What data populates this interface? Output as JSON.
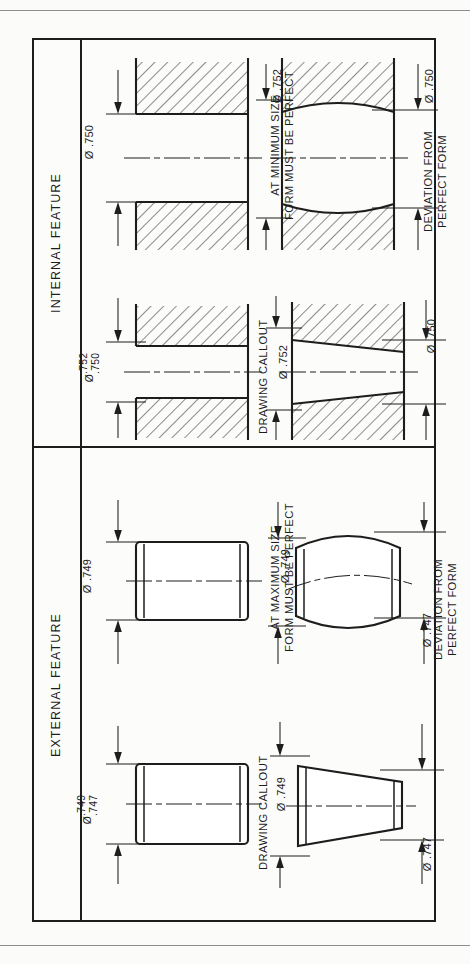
{
  "sheet": {
    "background": "#fbfbfa",
    "line_color": "#1d1d1d"
  },
  "sections": [
    {
      "id": "internal",
      "label": "INTERNAL FEATURE",
      "figures": [
        {
          "id": "internal-callout",
          "caption": "DRAWING CALLOUT",
          "dimensions": [
            {
              "id": "int-callout-dim",
              "symbol": "Ø",
              "values": [
                "  .752",
                "  .750"
              ],
              "position": "left"
            }
          ],
          "shape": "straight-bore-section"
        },
        {
          "id": "internal-taper",
          "caption": "",
          "dimensions": [
            {
              "id": "int-taper-left",
              "text": "Ø .752",
              "position": "left"
            },
            {
              "id": "int-taper-right",
              "text": "Ø .750",
              "position": "right"
            }
          ],
          "shape": "tapered-bore-section"
        },
        {
          "id": "internal-min-size",
          "caption": "AT MINIMUM SIZE\nFORM MUST BE PERFECT",
          "caption_line1": "AT MINIMUM SIZE",
          "caption_line2": "FORM MUST BE PERFECT",
          "dimensions": [
            {
              "id": "int-min-dim",
              "text": "Ø .750",
              "position": "left"
            }
          ],
          "shape": "straight-bore-section"
        },
        {
          "id": "internal-deviation",
          "caption_line1": "DEVIATION FROM",
          "caption_line2": "PERFECT FORM",
          "dimensions": [
            {
              "id": "int-dev-left",
              "text": "Ø .752",
              "position": "left"
            },
            {
              "id": "int-dev-right",
              "text": "Ø .750",
              "position": "right"
            }
          ],
          "shape": "barrel-bore-section"
        }
      ]
    },
    {
      "id": "external",
      "label": "EXTERNAL FEATURE",
      "figures": [
        {
          "id": "external-callout",
          "caption": "DRAWING CALLOUT",
          "dimensions": [
            {
              "id": "ext-callout-dim",
              "symbol": "Ø",
              "values": [
                "  .749",
                "  .747"
              ],
              "position": "left"
            }
          ],
          "shape": "straight-pin"
        },
        {
          "id": "external-taper",
          "caption": "",
          "dimensions": [
            {
              "id": "ext-taper-left",
              "text": "Ø .749",
              "position": "left"
            },
            {
              "id": "ext-taper-right",
              "text": "Ø .747",
              "position": "right"
            }
          ],
          "shape": "tapered-pin"
        },
        {
          "id": "external-max-size",
          "caption_line1": "AT MAXIMUM SIZE",
          "caption_line2": "FORM MUST BE PERFECT",
          "dimensions": [
            {
              "id": "ext-max-dim",
              "text": "Ø .749",
              "position": "left"
            }
          ],
          "shape": "straight-pin"
        },
        {
          "id": "external-deviation",
          "caption_line1": "DEVIATION FROM",
          "caption_line2": "PERFECT FORM",
          "dimensions": [
            {
              "id": "ext-dev-left",
              "text": "Ø .749",
              "position": "left"
            },
            {
              "id": "ext-dev-right",
              "text": "Ø .747",
              "position": "right"
            }
          ],
          "shape": "bent-pin"
        }
      ]
    }
  ],
  "symbols": {
    "diameter": "Ø"
  }
}
